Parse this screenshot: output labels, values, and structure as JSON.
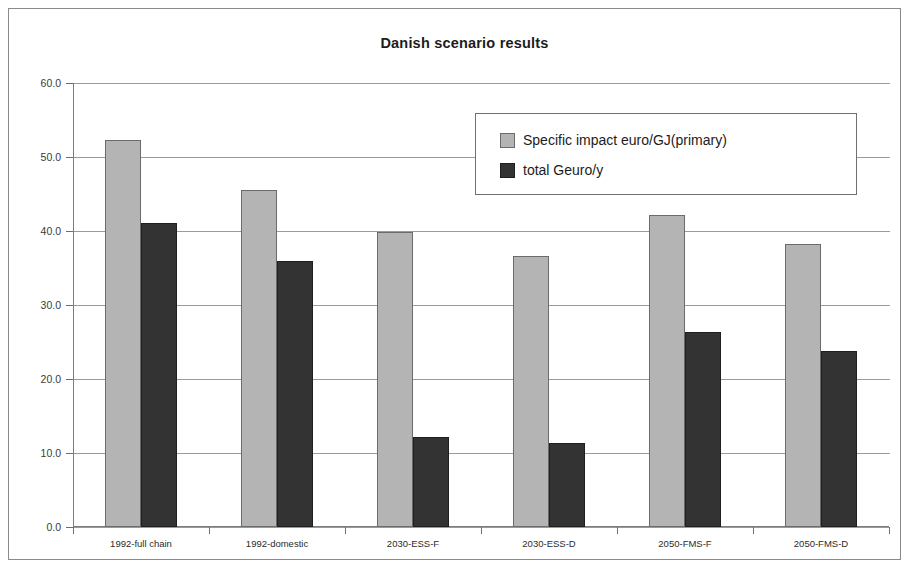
{
  "chart_data": {
    "type": "bar",
    "title": "Danish scenario results",
    "xlabel": "",
    "ylabel": "",
    "ylim": [
      0.0,
      60.0
    ],
    "yticks": [
      "0.0",
      "10.0",
      "20.0",
      "30.0",
      "40.0",
      "50.0",
      "60.0"
    ],
    "grid": true,
    "legend_position": "upper-right-inside",
    "categories": [
      "1992-full chain",
      "1992-domestic",
      "2030-ESS-F",
      "2030-ESS-D",
      "2050-FMS-F",
      "2050-FMS-D"
    ],
    "series": [
      {
        "name": "Specific impact euro/GJ(primary)",
        "color": "#b4b4b4",
        "values": [
          52.3,
          45.6,
          39.8,
          36.6,
          42.2,
          38.3
        ]
      },
      {
        "name": "total Geuro/y",
        "color": "#333333",
        "values": [
          41.1,
          36.0,
          12.2,
          11.3,
          26.3,
          23.8
        ]
      }
    ]
  },
  "style": {
    "axis_color": "#7d7d7d",
    "grid_color": "#9a9a9a",
    "frame_color": "#8a8a8a",
    "text_color": "#1c1c1c"
  }
}
